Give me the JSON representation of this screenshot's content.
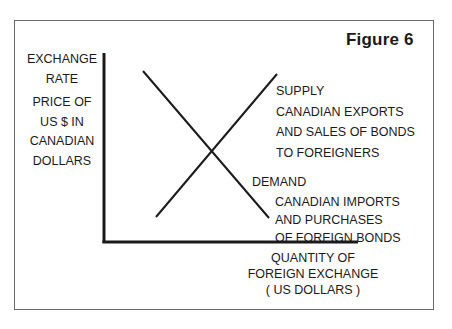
{
  "figure": {
    "title": "Figure 6",
    "type": "supply-demand diagram",
    "y_axis": {
      "label_lines": [
        "EXCHANGE",
        "RATE"
      ],
      "sublabel_lines": [
        "PRICE OF",
        "US $  IN",
        "CANADIAN",
        "DOLLARS"
      ]
    },
    "x_axis": {
      "label_lines": [
        "QUANTITY OF",
        "FOREIGN EXCHANGE",
        "(  US  DOLLARS  )"
      ]
    },
    "curves": [
      {
        "name": "SUPPLY",
        "description_lines": [
          "CANADIAN EXPORTS",
          "AND SALES OF BONDS",
          "TO FOREIGNERS"
        ],
        "slope": "upward",
        "from": [
          156,
          217
        ],
        "to": [
          277,
          74
        ]
      },
      {
        "name": "DEMAND",
        "description_lines": [
          "CANADIAN IMPORTS",
          "AND PURCHASES",
          "OF FOREIGN BONDS"
        ],
        "slope": "downward",
        "from": [
          143,
          71
        ],
        "to": [
          269,
          218
        ]
      }
    ],
    "colors": {
      "ink": "#1a1a1a",
      "frame": "#6a6a6a",
      "background": "#ffffff"
    }
  }
}
